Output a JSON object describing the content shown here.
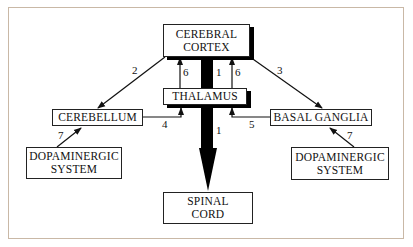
{
  "diagram": {
    "nodes": {
      "cerebral_cortex": {
        "line1": "CEREBRAL",
        "line2": "CORTEX"
      },
      "thalamus": {
        "label": "THALAMUS"
      },
      "cerebellum": {
        "label": "CEREBELLUM"
      },
      "basal_ganglia": {
        "label": "BASAL GANGLIA"
      },
      "dopaminergic_left": {
        "line1": "DOPAMINERGIC",
        "line2": "SYSTEM"
      },
      "dopaminergic_right": {
        "line1": "DOPAMINERGIC",
        "line2": "SYSTEM"
      },
      "spinal_cord": {
        "line1": "SPINAL",
        "line2": "CORD"
      }
    },
    "edges": [
      {
        "from": "cerebral_cortex",
        "to": "cerebellum",
        "label": "2"
      },
      {
        "from": "cerebral_cortex",
        "to": "basal_ganglia",
        "label": "3"
      },
      {
        "from": "thalamus",
        "to": "cerebral_cortex",
        "label": "6",
        "side": "left"
      },
      {
        "from": "thalamus",
        "to": "cerebral_cortex",
        "label": "6",
        "side": "right"
      },
      {
        "from": "cerebral_cortex",
        "to": "spinal_cord",
        "label": "1",
        "segment": "upper"
      },
      {
        "from": "cerebral_cortex",
        "to": "spinal_cord",
        "label": "1",
        "segment": "lower"
      },
      {
        "from": "cerebellum",
        "to": "thalamus",
        "label": "4"
      },
      {
        "from": "basal_ganglia",
        "to": "thalamus",
        "label": "5"
      },
      {
        "from": "dopaminergic_left",
        "to": "cerebellum",
        "label": "7"
      },
      {
        "from": "dopaminergic_right",
        "to": "basal_ganglia",
        "label": "7"
      }
    ]
  },
  "colors": {
    "frame": "#c9b8a6",
    "ink": "#111111",
    "background": "#ffffff"
  }
}
